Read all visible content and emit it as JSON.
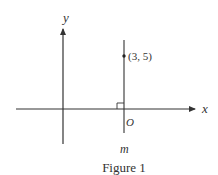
{
  "figure": {
    "caption": "Figure 1",
    "axes": {
      "x_label": "x",
      "y_label": "y"
    },
    "origin_label": "O",
    "line_label": "m",
    "point_label": "(3, 5)",
    "stroke_color": "#333333"
  }
}
